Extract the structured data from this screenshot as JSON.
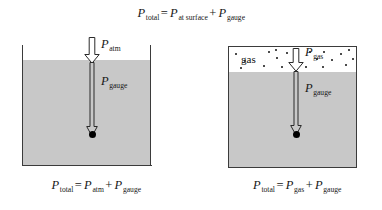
{
  "figure": {
    "top_equation": {
      "lhs_symbol": "P",
      "lhs_sub": "total",
      "equals": "=",
      "term1_symbol": "P",
      "term1_sub": "at surface",
      "plus": "+",
      "term2_symbol": "P",
      "term2_sub": "gauge"
    },
    "left_panel": {
      "caption": {
        "lhs_symbol": "P",
        "lhs_sub": "total",
        "equals": "=",
        "term1_symbol": "P",
        "term1_sub": "atm",
        "plus": "+",
        "term2_symbol": "P",
        "term2_sub": "gauge"
      },
      "arrows": [
        {
          "symbol": "P",
          "sub": "atm"
        },
        {
          "symbol": "P",
          "sub": "gauge"
        }
      ]
    },
    "right_panel": {
      "gas_label": "gas",
      "caption": {
        "lhs_symbol": "P",
        "lhs_sub": "total",
        "equals": "=",
        "term1_symbol": "P",
        "term1_sub": "gas",
        "plus": "+",
        "term2_symbol": "P",
        "term2_sub": "gauge"
      },
      "arrows": [
        {
          "symbol": "P",
          "sub": "gas"
        },
        {
          "symbol": "P",
          "sub": "gauge"
        }
      ]
    },
    "colors": {
      "liquid": "#c8c8c8",
      "wall": "#3b3b3b",
      "gas": "#ffffff",
      "point": "#000000",
      "arrow_stroke": "#2a2a2a"
    }
  }
}
